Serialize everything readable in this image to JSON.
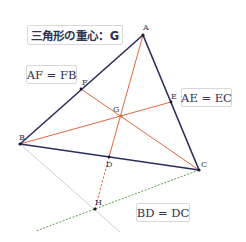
{
  "diagram": {
    "title": "三角形の重心：G",
    "equalities": {
      "af_fb": "AF = FB",
      "ae_ec": "AE = EC",
      "bd_dc": "BD = DC"
    },
    "points": {
      "A": {
        "label": "A",
        "x": 143,
        "y": 35
      },
      "B": {
        "label": "B",
        "x": 20,
        "y": 144
      },
      "C": {
        "label": "C",
        "x": 199,
        "y": 170
      },
      "D": {
        "label": "D",
        "x": 109,
        "y": 157
      },
      "E": {
        "label": "E",
        "x": 171,
        "y": 102
      },
      "F": {
        "label": "F",
        "x": 81,
        "y": 89
      },
      "G": {
        "label": "G",
        "x": 121,
        "y": 116
      },
      "H": {
        "label": "H",
        "x": 95,
        "y": 209
      }
    },
    "colors": {
      "triangle": "#2b2d5c",
      "median": "#e0663f",
      "guide_gray": "#cfcfcf",
      "guide_green": "#5a9a4a",
      "text": "#2e3150"
    }
  }
}
